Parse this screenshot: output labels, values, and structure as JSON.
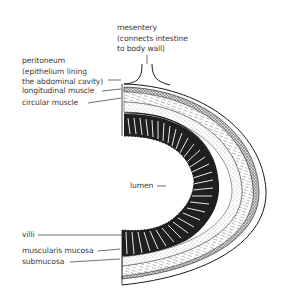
{
  "diagram": {
    "labels": {
      "mesentery": [
        "mesentery",
        "(connects intestine",
        "to body wall)"
      ],
      "peritoneum": [
        "peritoneum",
        "(epithelium lining",
        "the abdominal cavity)"
      ],
      "longitudinal_muscle": "longitudinal muscle",
      "circular_muscle": "circular muscle",
      "lumen": "lumen",
      "villi": "villi",
      "muscularis_mucosa": "muscularis mucosa",
      "submucosa": "submucosa"
    },
    "colors": {
      "ink": "#1a1a1a",
      "text": "#3a3a3a",
      "background": "#ffffff"
    }
  }
}
